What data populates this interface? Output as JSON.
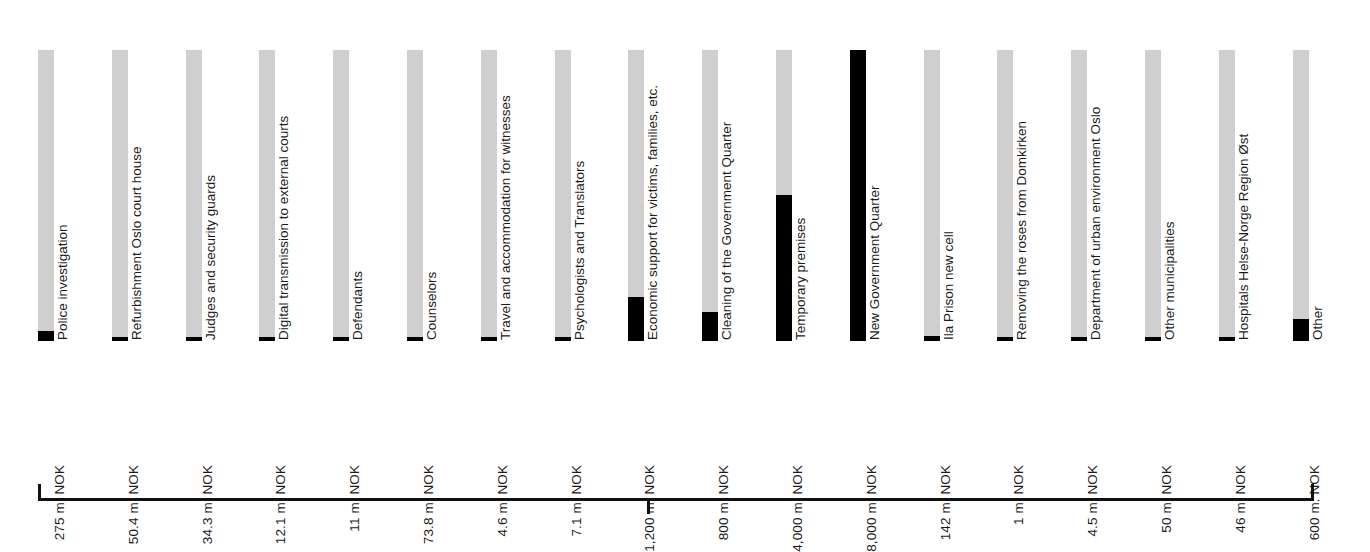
{
  "chart_data": {
    "type": "bar",
    "title": "",
    "subtitle": "",
    "xlabel": "",
    "ylabel": "",
    "orientation": "vertical",
    "grid": false,
    "legend": "none",
    "axis": {
      "bracket": true,
      "center_tick": true,
      "left_cap": true,
      "right_cap": true
    },
    "scale_max": 8000,
    "unit": "m. NOK",
    "track_color": "#cfcfcf",
    "fill_color": "#000000",
    "categories": [
      "Police investigation",
      "Refurbishment Oslo court house",
      "Judges and security guards",
      "Digital transmission to external courts",
      "Defendants",
      "Counselors",
      "Travel and accommodation for witnesses",
      "Psychologists and Translators",
      "Economic support for victims, families, etc.",
      "Cleaning of the Government Quarter",
      "Temporary premises",
      "New Government Quarter",
      "Ila Prison new cell",
      "Removing the roses from Domkirken",
      "Department of urban environment Oslo",
      "Other municipalities",
      "Hospitals Helse-Norge Region Øst",
      "Other"
    ],
    "values": [
      275,
      50.4,
      34.3,
      12.1,
      11,
      73.8,
      4.6,
      7.1,
      1200,
      800,
      4000,
      8000,
      142,
      1,
      4.5,
      50,
      46,
      600
    ],
    "value_labels": [
      "275 m. NOK",
      "50.4 m. NOK",
      "34.3 m. NOK",
      "12.1 m. NOK",
      "11 m. NOK",
      "73.8 m. NOK",
      "4.6 m. NOK",
      "7.1 m. NOK",
      "1,200 m. NOK",
      "800 m. NOK",
      "4,000 m. NOK",
      "8,000 m. NOK",
      "142 m. NOK",
      "1 m. NOK",
      "4.5 m. NOK",
      "50 m. NOK",
      "46 m. NOK",
      "600 m. NOK"
    ]
  }
}
